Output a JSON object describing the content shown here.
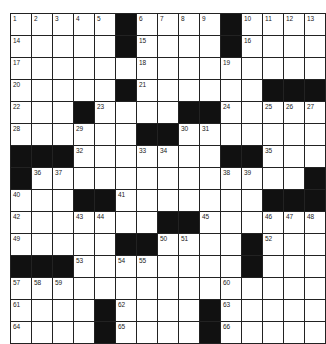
{
  "puzzle": {
    "rows": 15,
    "cols": 15,
    "colors": {
      "black": "#111111",
      "white": "#ffffff",
      "line": "#222222"
    },
    "grid": [
      ".....#....#....",
      ".....#....#....",
      "...............",
      ".....#......###",
      "...#....##.....",
      "......##.......",
      "###.......##...",
      "#.............#",
      "...##.......###",
      ".......##......",
      ".....##....#...",
      "###........#...",
      "...............",
      "....#....#.....",
      "....#....#....."
    ],
    "numbers": [
      [
        0,
        0,
        1
      ],
      [
        0,
        1,
        2
      ],
      [
        0,
        2,
        3
      ],
      [
        0,
        3,
        4
      ],
      [
        0,
        4,
        5
      ],
      [
        0,
        6,
        6
      ],
      [
        0,
        7,
        7
      ],
      [
        0,
        8,
        8
      ],
      [
        0,
        9,
        9
      ],
      [
        0,
        11,
        10
      ],
      [
        0,
        12,
        11
      ],
      [
        0,
        13,
        12
      ],
      [
        0,
        14,
        13
      ],
      [
        1,
        0,
        14
      ],
      [
        1,
        6,
        15
      ],
      [
        1,
        11,
        16
      ],
      [
        2,
        0,
        17
      ],
      [
        2,
        6,
        18
      ],
      [
        2,
        10,
        19
      ],
      [
        3,
        0,
        20
      ],
      [
        3,
        6,
        21
      ],
      [
        4,
        0,
        22
      ],
      [
        4,
        4,
        23
      ],
      [
        4,
        10,
        24
      ],
      [
        4,
        12,
        25
      ],
      [
        4,
        13,
        26
      ],
      [
        4,
        14,
        27
      ],
      [
        5,
        0,
        28
      ],
      [
        5,
        3,
        29
      ],
      [
        5,
        8,
        30
      ],
      [
        5,
        9,
        31
      ],
      [
        6,
        3,
        32
      ],
      [
        6,
        6,
        33
      ],
      [
        6,
        7,
        34
      ],
      [
        6,
        12,
        35
      ],
      [
        7,
        1,
        36
      ],
      [
        7,
        2,
        37
      ],
      [
        7,
        10,
        38
      ],
      [
        7,
        11,
        39
      ],
      [
        8,
        0,
        40
      ],
      [
        8,
        5,
        41
      ],
      [
        9,
        0,
        42
      ],
      [
        9,
        3,
        43
      ],
      [
        9,
        4,
        44
      ],
      [
        9,
        9,
        45
      ],
      [
        9,
        12,
        46
      ],
      [
        9,
        13,
        47
      ],
      [
        9,
        14,
        48
      ],
      [
        10,
        0,
        49
      ],
      [
        10,
        7,
        50
      ],
      [
        10,
        8,
        51
      ],
      [
        10,
        12,
        52
      ],
      [
        11,
        3,
        53
      ],
      [
        11,
        5,
        54
      ],
      [
        11,
        6,
        55
      ],
      [
        11,
        11,
        56
      ],
      [
        12,
        0,
        57
      ],
      [
        12,
        1,
        58
      ],
      [
        12,
        2,
        59
      ],
      [
        12,
        10,
        60
      ],
      [
        13,
        0,
        61
      ],
      [
        13,
        5,
        62
      ],
      [
        13,
        10,
        63
      ],
      [
        14,
        0,
        64
      ],
      [
        14,
        5,
        65
      ],
      [
        14,
        10,
        66
      ]
    ]
  }
}
